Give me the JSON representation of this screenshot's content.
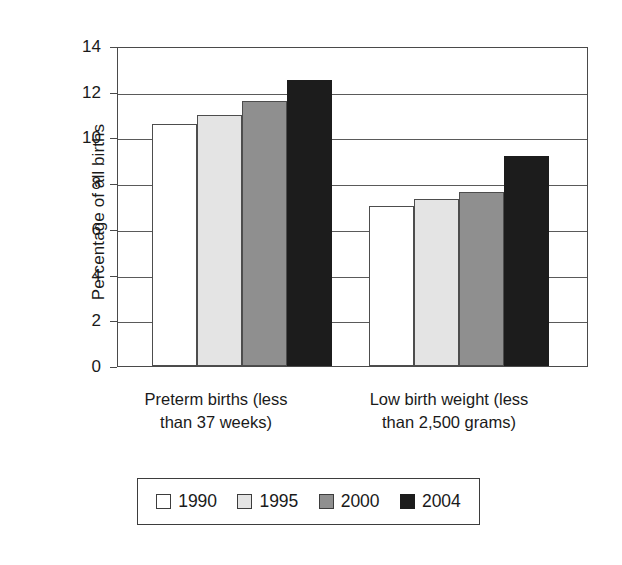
{
  "chart_data": {
    "type": "bar",
    "title": "",
    "subtitle": "",
    "xlabel": "",
    "ylabel": "Percentage of all births",
    "ylim": [
      0,
      14
    ],
    "ytick_step": 2,
    "yticks": [
      "14",
      "12",
      "10",
      "8",
      "6",
      "4",
      "2",
      "0"
    ],
    "grid": true,
    "legend_position": "bottom",
    "categories": [
      "Preterm births (less than 37 weeks)",
      "Low birth weight (less than 2,500 grams)"
    ],
    "category_lines": [
      [
        "Preterm births (less",
        "than 37 weeks)"
      ],
      [
        "Low birth weight (less",
        "than 2,500 grams)"
      ]
    ],
    "series": [
      {
        "name": "1990",
        "color": "#ffffff",
        "values": [
          10.6,
          7.0
        ]
      },
      {
        "name": "1995",
        "color": "#e4e4e4",
        "values": [
          11.0,
          7.3
        ]
      },
      {
        "name": "2000",
        "color": "#8f8f8f",
        "values": [
          11.6,
          7.6
        ]
      },
      {
        "name": "2004",
        "color": "#1c1c1c",
        "values": [
          12.5,
          9.2
        ]
      }
    ]
  },
  "legend": {
    "entries": [
      {
        "label": "1990",
        "swatch": "white-square-swatch"
      },
      {
        "label": "1995",
        "swatch": "light-gray-square-swatch"
      },
      {
        "label": "2000",
        "swatch": "medium-gray-square-swatch"
      },
      {
        "label": "2004",
        "swatch": "black-square-swatch"
      }
    ]
  }
}
